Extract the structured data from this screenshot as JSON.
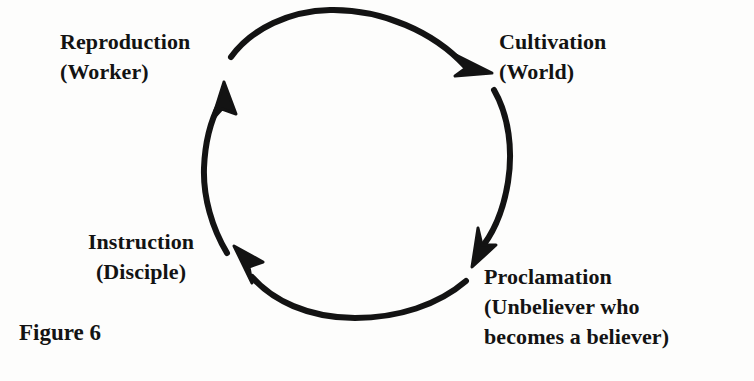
{
  "figure": {
    "caption": "Figure 6",
    "background_color": "#fdfdfc",
    "ink_color": "#131313"
  },
  "diagram": {
    "type": "cycle",
    "direction": "clockwise",
    "node_count": 4,
    "circle": {
      "center_x": 357,
      "center_y": 164,
      "radius": 154
    },
    "nodes": [
      {
        "id": "cultivation",
        "title": "Cultivation",
        "subtitle": "(World)",
        "position": "top-right"
      },
      {
        "id": "proclamation",
        "title": "Proclamation",
        "subtitle": "(Unbeliever who",
        "subtitle2": "becomes a believer)",
        "position": "bottom-right"
      },
      {
        "id": "instruction",
        "title": "Instruction",
        "subtitle": "(Disciple)",
        "position": "bottom-left"
      },
      {
        "id": "reproduction",
        "title": "Reproduction",
        "subtitle": "(Worker)",
        "position": "top-left"
      }
    ],
    "arrows": [
      {
        "id": "arrow-to-cultivation",
        "from": "reproduction",
        "to": "cultivation"
      },
      {
        "id": "arrow-to-proclamation",
        "from": "cultivation",
        "to": "proclamation"
      },
      {
        "id": "arrow-to-instruction",
        "from": "proclamation",
        "to": "instruction"
      },
      {
        "id": "arrow-to-reproduction",
        "from": "instruction",
        "to": "reproduction"
      }
    ]
  }
}
